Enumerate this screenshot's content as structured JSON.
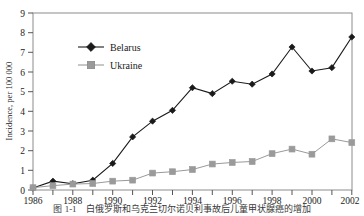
{
  "figure": {
    "caption": "图 1-1　白俄罗斯和乌克兰切尔诺贝利事故后儿童甲状腺癌的增加"
  },
  "chart_data": {
    "type": "line",
    "title": "",
    "xlabel": "",
    "ylabel": "Incidence, per 100 000",
    "xlim": [
      1986,
      2002
    ],
    "ylim": [
      0,
      9
    ],
    "grid": false,
    "legend_position": "upper-left-inside",
    "x_ticks": [
      "1986",
      "1988",
      "1990",
      "1992",
      "1994",
      "1996",
      "1998",
      "2000",
      "2002"
    ],
    "y_ticks": [
      "0",
      "1",
      "2",
      "3",
      "4",
      "5",
      "6",
      "7",
      "8",
      "9"
    ],
    "x": [
      1986,
      1987,
      1988,
      1989,
      1990,
      1991,
      1992,
      1993,
      1994,
      1995,
      1996,
      1997,
      1998,
      1999,
      2000,
      2001,
      2002
    ],
    "series": [
      {
        "name": "Belarus",
        "color": "#1a1a1a",
        "marker": "diamond",
        "values": [
          0.1,
          0.45,
          0.32,
          0.5,
          1.35,
          2.7,
          3.5,
          4.05,
          5.2,
          4.9,
          5.53,
          5.38,
          5.9,
          7.27,
          6.05,
          6.22,
          7.78
        ]
      },
      {
        "name": "Ukraine",
        "color": "#9a9a9a",
        "marker": "square",
        "values": [
          0.12,
          0.22,
          0.3,
          0.33,
          0.45,
          0.5,
          0.86,
          0.93,
          1.04,
          1.32,
          1.4,
          1.45,
          1.85,
          2.08,
          1.82,
          2.6,
          2.41
        ]
      }
    ]
  }
}
